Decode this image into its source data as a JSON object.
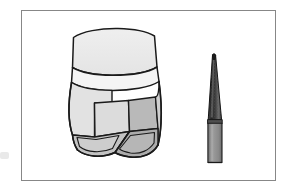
{
  "figure": {
    "caption": "",
    "background_color": "#ffffff",
    "frame": {
      "border_color": "#878787",
      "border_width_px": 1,
      "x": 21,
      "y": 10,
      "width": 255,
      "height": 171
    }
  },
  "palette": {
    "outline": "#1a1a1a",
    "enamel_light": "#ececec",
    "enamel_lighter": "#f2f2f2",
    "dentin_light": "#dedede",
    "dentin_mid": "#b9b9b9",
    "dentin_shadow": "#a8a8a8",
    "cusp_gray": "#c2c2c2",
    "bur_head_dark": "#2e2e2e",
    "bur_head_mid": "#5a5a5a",
    "bur_shank": "#8f8f8f",
    "page_white": "#ffffff",
    "edge_smudge": "#e9e9e9"
  },
  "objects": [
    {
      "id": "tooth",
      "name": "prepared-molar-tooth",
      "label": "Prepared molar tooth with occlusal reduction",
      "x": 72,
      "y": 35,
      "width": 92,
      "height": 122,
      "parts": [
        {
          "name": "crown-occlusal-table",
          "shade": "enamel_light"
        },
        {
          "name": "cervical-band",
          "shade": "enamel_lighter"
        },
        {
          "name": "mesial-axial-wall",
          "shade": "dentin_light"
        },
        {
          "name": "distal-axial-wall",
          "shade": "dentin_mid"
        },
        {
          "name": "buccal-cusp-facet",
          "shade": "cusp_gray"
        },
        {
          "name": "lingual-cusp-facet",
          "shade": "dentin_shadow"
        }
      ]
    },
    {
      "id": "bur",
      "name": "tapered-diamond-bur",
      "label": "Tapered diamond dental bur",
      "x": 203,
      "y": 62,
      "width": 22,
      "height": 100,
      "parts": [
        {
          "name": "bur-working-tip",
          "shade": "bur_head_dark"
        },
        {
          "name": "bur-diamond-head",
          "shade": "bur_head_mid"
        },
        {
          "name": "bur-shank",
          "shade": "bur_shank"
        }
      ]
    }
  ]
}
